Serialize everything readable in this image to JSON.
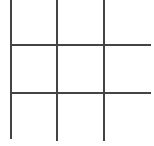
{
  "board": {
    "rows": 3,
    "cols": 3,
    "line_color": "#444444",
    "cells": [
      [
        "",
        "",
        ""
      ],
      [
        "",
        "",
        ""
      ],
      [
        "",
        "",
        ""
      ]
    ]
  }
}
